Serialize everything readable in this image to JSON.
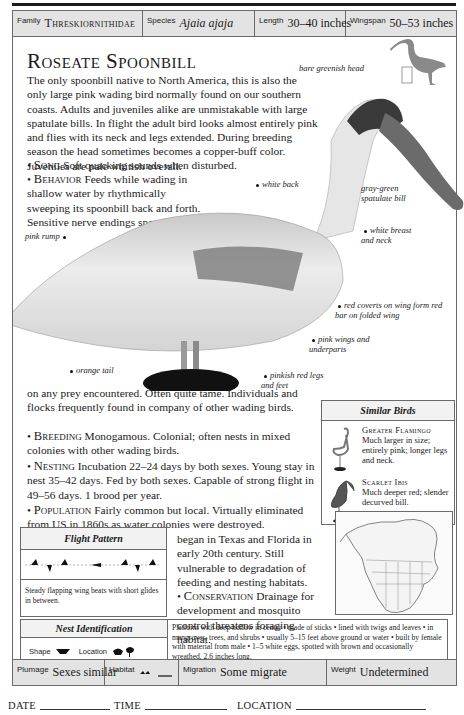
{
  "header": {
    "family_label": "Family",
    "family_value": "Threskiornithidae",
    "species_label": "Species",
    "species_value": "Ajaia ajaja",
    "length_label": "Length",
    "length_value": "30–40 inches",
    "wingspan_label": "Wingspan",
    "wingspan_value": "50–53 inches"
  },
  "title": "Roseate Spoonbill",
  "intro": "The only spoonbill native to North America, this is also the only large pink wading bird normally found on our southern coasts. Adults and juveniles alike are unmistakable with large spatulate bills. In flight the adult bird looks almost entirely pink and flies with its neck and legs extended. During breeding season the head sometimes becomes a copper-buff color. Juveniles are pale whitish overall.",
  "sections": {
    "song": {
      "label": "Song",
      "text": "Soft quacking sounds when disturbed."
    },
    "behavior": {
      "label": "Behavior",
      "text_part1": "Feeds while wading in shallow water by rhythmically sweeping its spoonbill back and forth. Sensitive nerve endings snap bill shut",
      "text_part2": "on any prey encountered. Often quite tame. Individuals and flocks frequently found in company of other wading birds."
    },
    "breeding": {
      "label": "Breeding",
      "text": "Monogamous. Colonial; often nests in mixed colonies with other wading birds."
    },
    "nesting": {
      "label": "Nesting",
      "text": "Incubation 22–24 days by both sexes. Young stay in nest 35–42 days. Fed by both sexes. Capable of strong flight in 49–56 days. 1 brood per year."
    },
    "population": {
      "label": "Population",
      "text_part1": "Fairly common but local. Virtually eliminated from US in 1860s as water colonies were destroyed. Recolonization",
      "text_part2": "began in Texas and Florida in early 20th century. Still vulnerable to degradation of feeding and nesting habitats."
    },
    "conservation": {
      "label": "Conservation",
      "text": "Drainage for development and mosquito control threatens foraging habitat."
    }
  },
  "callouts": {
    "head": "bare greenish head",
    "back": "white back",
    "bill": "gray-green spatulate bill",
    "rump": "pink rump",
    "breast": "white breast and neck",
    "coverts": "red coverts on wing form red bar on folded wing",
    "wings": "pink wings and underparts",
    "tail": "orange tail",
    "legs": "pinkish red legs and feet"
  },
  "similar_birds": {
    "title": "Similar Birds",
    "items": [
      {
        "name": "Greater Flamingo",
        "desc": "Much larger in size; entirely pink; longer legs and neck."
      },
      {
        "name": "Scarlet Ibis",
        "desc": "Much deeper red; slender decurved bill."
      }
    ]
  },
  "flight_pattern": {
    "title": "Flight Pattern",
    "caption": "Steady flapping wing beats with short glides in between."
  },
  "nest_identification": {
    "title": "Nest Identification",
    "shape_label": "Shape",
    "location_label": "Location",
    "description": "Platform with deep hollow in center • made of sticks • lined with twigs and leaves • in mangroves, trees, and shrubs • usually 5–15 feet above ground or water • built by female with material from male • 1–5 white eggs, spotted with brown and occasionally wreathed, 2.6 inches long."
  },
  "footer": {
    "plumage_label": "Plumage",
    "plumage_value": "Sexes similar",
    "habitat_label": "Habitat",
    "migration_label": "Migration",
    "migration_value": "Some migrate",
    "weight_label": "Weight",
    "weight_value": "Undetermined"
  },
  "log": {
    "date_label": "Date",
    "time_label": "Time",
    "location_label": "Location"
  }
}
